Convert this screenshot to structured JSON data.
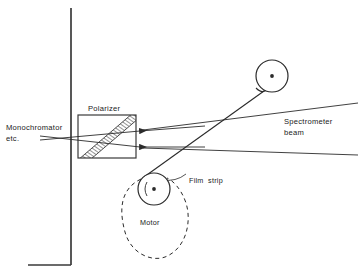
{
  "figure": {
    "type": "schematic-diagram",
    "background_color": "#ffffff",
    "line_color": "#2b2b2b",
    "text_color": "#1a1a1a"
  },
  "labels": {
    "monochromator_line1": "Monochromator",
    "monochromator_line2": "etc.",
    "polarizer": "Polarizer",
    "spectrometer_line1": "Spectrometer",
    "spectrometer_line2": "beam",
    "film_strip": "Film  strip",
    "motor": "Motor"
  },
  "components": {
    "wall": {
      "name": "vertical-wall",
      "x": 71,
      "y_top": 8,
      "y_bottom": 265,
      "foot_x_end": 28
    },
    "polarizer_box": {
      "name": "polarizer-housing",
      "x": 78,
      "y": 115,
      "width": 58,
      "height": 43,
      "hatch_band": "diagonal"
    },
    "upper_pulley": {
      "name": "upper-pulley",
      "cx": 272,
      "cy": 76,
      "r": 16,
      "hub_r": 1.9
    },
    "lower_pulley": {
      "name": "lower-pulley",
      "cx": 154,
      "cy": 189,
      "r": 16,
      "hub_r": 1.9
    },
    "motor_belt": {
      "name": "motor-drive-belt",
      "style": "dashed",
      "cx": 154,
      "cy": 222,
      "r": 36
    },
    "film_strip_path": {
      "name": "film-strip",
      "from": [
        262,
        92
      ],
      "to": [
        144,
        176
      ]
    },
    "beams": {
      "count": 2,
      "direction": "right-to-left",
      "arrowheads": 2
    }
  }
}
